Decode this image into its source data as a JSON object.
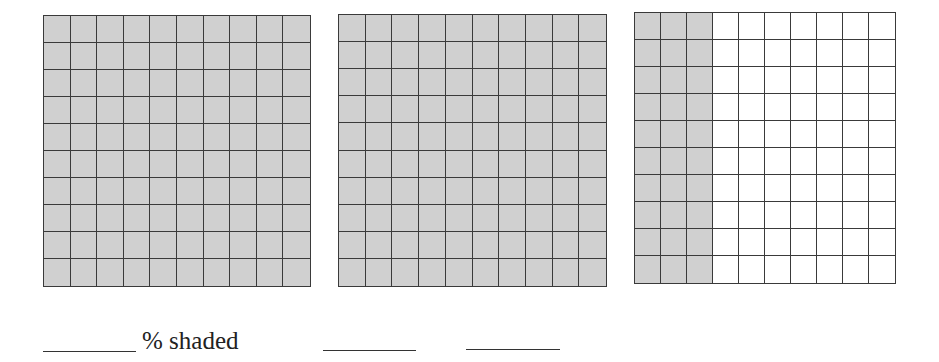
{
  "grids": [
    {
      "id": "grid-1",
      "rows": 10,
      "cols": 10,
      "shaded_columns": 10,
      "shaded_count": 100,
      "left": 43,
      "top": 15,
      "width": 268,
      "height": 272
    },
    {
      "id": "grid-2",
      "rows": 10,
      "cols": 10,
      "shaded_columns": 10,
      "shaded_count": 100,
      "left": 338,
      "top": 14,
      "width": 269,
      "height": 273
    },
    {
      "id": "grid-3",
      "rows": 10,
      "cols": 10,
      "shaded_columns": 3,
      "shaded_count": 30,
      "left": 634,
      "top": 12,
      "width": 262,
      "height": 272
    }
  ],
  "colors": {
    "shade": "#d0d0d0",
    "line": "#3a3a3a",
    "background": "#ffffff"
  },
  "answer_row": {
    "label": "% shaded",
    "blanks": [
      {
        "left": 43,
        "top": 351,
        "width": 93,
        "value": ""
      },
      {
        "left": 323,
        "top": 350,
        "width": 93,
        "value": ""
      },
      {
        "left": 466,
        "top": 349,
        "width": 94,
        "value": ""
      }
    ]
  }
}
